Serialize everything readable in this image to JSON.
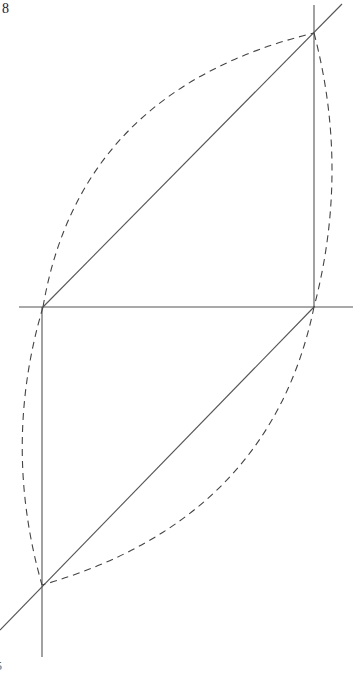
{
  "figure": {
    "number_label": "8",
    "corner_mark": "5",
    "width": 353,
    "height": 674,
    "colors": {
      "solid_line": "#555555",
      "dashed_line": "#444444",
      "background": "#ffffff"
    }
  },
  "points": {
    "A": {
      "x": 314,
      "y": 33
    },
    "B": {
      "x": 43,
      "y": 307
    },
    "C": {
      "x": 314,
      "y": 307
    },
    "D": {
      "x": 42,
      "y": 585
    }
  },
  "solid_lines": [
    {
      "name": "upper-diagonal",
      "x1": 342,
      "y1": 4,
      "x2": 43,
      "y2": 307
    },
    {
      "name": "lower-diagonal",
      "x1": 314,
      "y1": 307,
      "x2": 0,
      "y2": 630
    },
    {
      "name": "horizontal-axis",
      "x1": 19,
      "y1": 307,
      "x2": 353,
      "y2": 307
    },
    {
      "name": "right-vertical",
      "x1": 314,
      "y1": 5,
      "x2": 314,
      "y2": 307
    },
    {
      "name": "left-vertical",
      "x1": 42,
      "y1": 307,
      "x2": 42,
      "y2": 657
    }
  ],
  "dashed_curves": [
    {
      "name": "upper-left-arc",
      "d": "M 43 307 Q 80 90 314 33"
    },
    {
      "name": "upper-right-arc",
      "d": "M 314 33 Q 350 170 314 307"
    },
    {
      "name": "lower-left-arc",
      "d": "M 43 307 Q 2 445 42 585"
    },
    {
      "name": "lower-right-arc",
      "d": "M 314 307 Q 270 520 42 585"
    }
  ]
}
